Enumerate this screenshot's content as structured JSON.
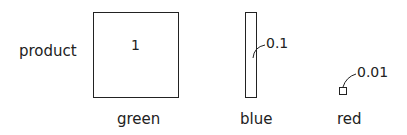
{
  "row_label": "product",
  "items": [
    {
      "name": "green",
      "value": "1"
    },
    {
      "name": "blue",
      "value": "0.1"
    },
    {
      "name": "red",
      "value": "0.01"
    }
  ]
}
